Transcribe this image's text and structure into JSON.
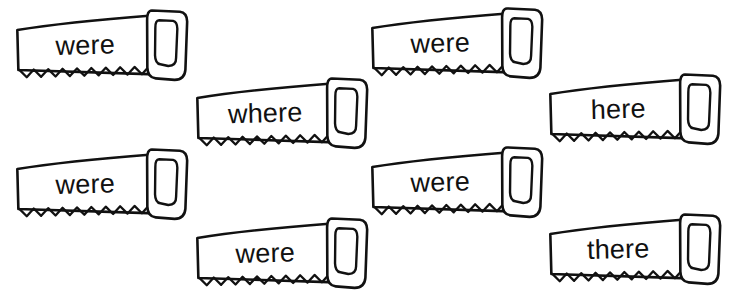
{
  "worksheet": {
    "title": "Sight Word Saws Worksheet",
    "background_color": "#ffffff",
    "ink_color": "#111111",
    "width": 733,
    "height": 302,
    "item_count": 8,
    "items": [
      {
        "id": "saw-1",
        "word": "were",
        "row": 1,
        "column": 1,
        "x": 16,
        "y": 16,
        "width": 175,
        "height": 66,
        "rotation": -1.5
      },
      {
        "id": "saw-2",
        "word": "were",
        "row": 1,
        "column": 2,
        "x": 371,
        "y": 14,
        "width": 175,
        "height": 66,
        "rotation": -1.5
      },
      {
        "id": "saw-3",
        "word": "where",
        "row": 2,
        "column": 1,
        "x": 196,
        "y": 84,
        "width": 175,
        "height": 66,
        "rotation": -1.5
      },
      {
        "id": "saw-4",
        "word": "here",
        "row": 2,
        "column": 2,
        "x": 549,
        "y": 80,
        "width": 175,
        "height": 66,
        "rotation": -1.5
      },
      {
        "id": "saw-5",
        "word": "were",
        "row": 3,
        "column": 1,
        "x": 16,
        "y": 155,
        "width": 175,
        "height": 66,
        "rotation": -1.5
      },
      {
        "id": "saw-6",
        "word": "were",
        "row": 3,
        "column": 2,
        "x": 371,
        "y": 153,
        "width": 175,
        "height": 66,
        "rotation": -1.5
      },
      {
        "id": "saw-7",
        "word": "were",
        "row": 4,
        "column": 1,
        "x": 196,
        "y": 224,
        "width": 175,
        "height": 66,
        "rotation": -1.5
      },
      {
        "id": "saw-8",
        "word": "there",
        "row": 4,
        "column": 2,
        "x": 549,
        "y": 220,
        "width": 175,
        "height": 66,
        "rotation": -1.5
      }
    ]
  }
}
